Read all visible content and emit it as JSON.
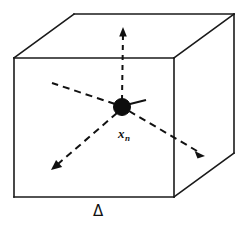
{
  "figure": {
    "background_color": "#ffffff",
    "line_color": "#1a1a1a",
    "node_color": "#0d0d0d",
    "width": 245,
    "height": 230
  },
  "labels": {
    "node_symbol": "x",
    "node_subscript": "n",
    "node_label_full": "x_n",
    "region_symbol": "Δ"
  },
  "cube": {
    "name": "wireframe-cube",
    "front_face": [
      [
        14,
        58
      ],
      [
        174,
        58
      ],
      [
        174,
        197
      ],
      [
        14,
        197
      ]
    ],
    "back_face": [
      [
        74,
        14
      ],
      [
        234,
        14
      ],
      [
        234,
        153
      ],
      [
        74,
        153
      ]
    ],
    "depth_offset": [
      60,
      -44
    ],
    "visible_back_vertices": [
      [
        74,
        14
      ],
      [
        234,
        14
      ],
      [
        234,
        153
      ]
    ],
    "hidden_back_vertex": [
      74,
      153
    ],
    "stroke_width": 1.6
  },
  "node": {
    "name": "center-node",
    "center": [
      122,
      107
    ],
    "radius": 8
  },
  "rays": [
    {
      "name": "ray-up",
      "from": [
        122,
        107
      ],
      "to": [
        123,
        30
      ],
      "dashed": true,
      "arrow": true,
      "label": "vertical up"
    },
    {
      "name": "ray-upper-left",
      "from": [
        122,
        107
      ],
      "to": [
        52,
        83
      ],
      "dashed": true,
      "arrow": false,
      "label": "upper left"
    },
    {
      "name": "ray-lower-left",
      "from": [
        122,
        107
      ],
      "to": [
        53,
        168
      ],
      "dashed": true,
      "arrow": true,
      "label": "lower left"
    },
    {
      "name": "ray-lower-right",
      "from": [
        122,
        107
      ],
      "to": [
        203,
        155
      ],
      "dashed": true,
      "arrow": true,
      "label": "lower right"
    },
    {
      "name": "ray-upper-right",
      "from": [
        122,
        107
      ],
      "to": [
        146,
        100
      ],
      "dashed": false,
      "arrow": false,
      "label": "short upper right"
    }
  ]
}
